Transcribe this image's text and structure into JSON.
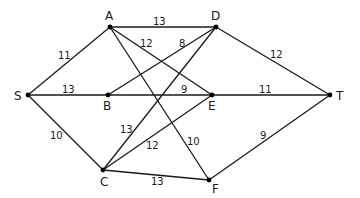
{
  "graph": {
    "type": "weighted-undirected-network",
    "nodes": [
      {
        "id": "S",
        "label": "S",
        "x": 28,
        "y": 95,
        "lx": 14,
        "ly": 100
      },
      {
        "id": "A",
        "label": "A",
        "x": 110,
        "y": 27,
        "lx": 105,
        "ly": 20
      },
      {
        "id": "D",
        "label": "D",
        "x": 216,
        "y": 27,
        "lx": 211,
        "ly": 20
      },
      {
        "id": "B",
        "label": "B",
        "x": 108,
        "y": 95,
        "lx": 103,
        "ly": 110
      },
      {
        "id": "E",
        "label": "E",
        "x": 212,
        "y": 95,
        "lx": 208,
        "ly": 110
      },
      {
        "id": "T",
        "label": "T",
        "x": 330,
        "y": 95,
        "lx": 336,
        "ly": 100
      },
      {
        "id": "C",
        "label": "C",
        "x": 103,
        "y": 170,
        "lx": 100,
        "ly": 186
      },
      {
        "id": "F",
        "label": "F",
        "x": 209,
        "y": 180,
        "lx": 212,
        "ly": 193
      }
    ],
    "edges": [
      {
        "from": "S",
        "to": "A",
        "weight": "11",
        "lx": 58,
        "ly": 59
      },
      {
        "from": "S",
        "to": "B",
        "weight": "13",
        "lx": 62,
        "ly": 93
      },
      {
        "from": "S",
        "to": "C",
        "weight": "10",
        "lx": 50,
        "ly": 139
      },
      {
        "from": "A",
        "to": "D",
        "weight": "13",
        "lx": 153,
        "ly": 25
      },
      {
        "from": "A",
        "to": "E",
        "weight": "12",
        "lx": 140,
        "ly": 47
      },
      {
        "from": "A",
        "to": "F",
        "weight": "10",
        "lx": 187,
        "ly": 145
      },
      {
        "from": "B",
        "to": "D",
        "weight": "8",
        "lx": 179,
        "ly": 47
      },
      {
        "from": "B",
        "to": "E",
        "weight": "9",
        "lx": 181,
        "ly": 93
      },
      {
        "from": "C",
        "to": "D",
        "weight": "13",
        "lx": 120,
        "ly": 133
      },
      {
        "from": "C",
        "to": "E",
        "weight": "12",
        "lx": 146,
        "ly": 149
      },
      {
        "from": "C",
        "to": "F",
        "weight": "13",
        "lx": 151,
        "ly": 185
      },
      {
        "from": "D",
        "to": "T",
        "weight": "12",
        "lx": 270,
        "ly": 58
      },
      {
        "from": "E",
        "to": "T",
        "weight": "11",
        "lx": 259,
        "ly": 93
      },
      {
        "from": "F",
        "to": "T",
        "weight": "9",
        "lx": 260,
        "ly": 139
      }
    ]
  },
  "colors": {
    "line": "#1a1a1a",
    "node": "#000000",
    "background": "#ffffff"
  }
}
